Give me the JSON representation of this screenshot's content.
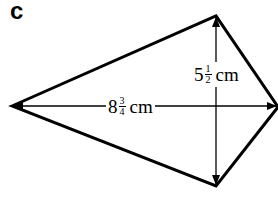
{
  "figure": {
    "label": "c",
    "shape": "kite",
    "vertices": {
      "left": [
        12,
        106
      ],
      "top": [
        216,
        16
      ],
      "right": [
        278,
        107
      ],
      "bottom": [
        216,
        186
      ]
    },
    "line_color": "#000000",
    "diagonals": [
      {
        "name": "horizontal",
        "whole": "8",
        "numerator": "3",
        "denominator": "4",
        "unit": "cm"
      },
      {
        "name": "vertical",
        "whole": "5",
        "numerator": "1",
        "denominator": "2",
        "unit": "cm"
      }
    ]
  }
}
